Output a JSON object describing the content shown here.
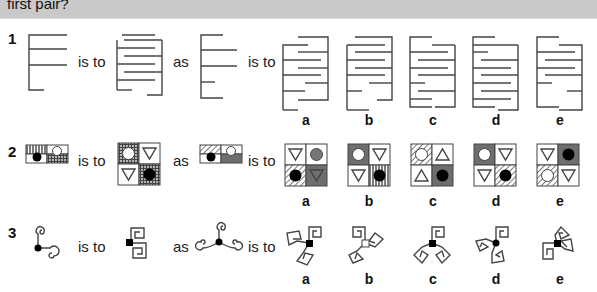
{
  "header": {
    "text": "first pair?"
  },
  "connectors": {
    "is_to": "is to",
    "as": "as"
  },
  "questions": [
    {
      "number": "1",
      "options": [
        "a",
        "b",
        "c",
        "d",
        "e"
      ]
    },
    {
      "number": "2",
      "options": [
        "a",
        "b",
        "c",
        "d",
        "e"
      ]
    },
    {
      "number": "3",
      "options": [
        "a",
        "b",
        "c",
        "d",
        "e"
      ]
    }
  ],
  "colors": {
    "header_bg": "#c9c9c9",
    "dark_gray": "#6e6e6e",
    "black": "#000000",
    "line": "#444444"
  }
}
